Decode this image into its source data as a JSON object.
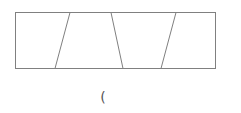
{
  "diagram": {
    "stroke_color": "#808080",
    "stroke_width": 1,
    "outer_rect": {
      "x1": 15,
      "y1": 12,
      "x2": 215,
      "y2": 68
    },
    "dividers": [
      {
        "top_x": 70,
        "bottom_x": 55
      },
      {
        "top_x": 111,
        "bottom_x": 123
      },
      {
        "top_x": 176,
        "bottom_x": 161
      }
    ],
    "section_count": 4
  },
  "caption": {
    "text": "("
  }
}
